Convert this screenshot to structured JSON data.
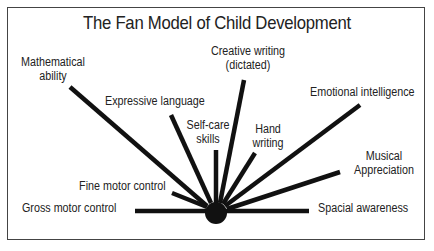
{
  "title": "The Fan Model of Child Development",
  "colors": {
    "line": "#111111",
    "text": "#222222",
    "border": "#444444",
    "background": "#ffffff"
  },
  "hub": {
    "cx": 216,
    "cy": 213,
    "r": 11
  },
  "spokes": [
    {
      "id": "mathematical-ability",
      "label": "Mathematical\nability",
      "line": [
        70,
        87,
        207,
        206
      ]
    },
    {
      "id": "expressive-language",
      "label": "Expressive language",
      "line": [
        171,
        115,
        211,
        203
      ]
    },
    {
      "id": "self-care-skills",
      "label": "Self-care\nskills",
      "line": [
        216,
        150,
        216,
        200
      ]
    },
    {
      "id": "creative-writing",
      "label": "Creative writing\n(dictated)",
      "line": [
        244,
        80,
        221,
        201
      ]
    },
    {
      "id": "hand-writing",
      "label": "Hand\nwriting",
      "line": [
        255,
        153,
        224,
        203
      ]
    },
    {
      "id": "emotional-intelligence",
      "label": "Emotional intelligence",
      "line": [
        360,
        105,
        226,
        204
      ]
    },
    {
      "id": "musical-appreciation",
      "label": "Musical\nAppreciation",
      "line": [
        340,
        172,
        228,
        208
      ]
    },
    {
      "id": "spacial-awareness",
      "label": "Spacial awareness",
      "line": [
        309,
        211,
        230,
        211
      ]
    },
    {
      "id": "gross-motor-control",
      "label": "Gross motor control",
      "line": [
        135,
        211,
        203,
        211
      ]
    },
    {
      "id": "fine-motor-control",
      "label": "Fine motor control",
      "line": [
        172,
        193,
        205,
        207
      ]
    }
  ],
  "labels": {
    "mathematical_line1": "Mathematical",
    "mathematical_line2": "ability",
    "expressive_language": "Expressive language",
    "self_care_line1": "Self-care",
    "self_care_line2": "skills",
    "creative_writing_line1": "Creative writing",
    "creative_writing_line2": "(dictated)",
    "hand_writing_line1": "Hand",
    "hand_writing_line2": "writing",
    "emotional_intelligence": "Emotional intelligence",
    "musical_line1": "Musical",
    "musical_line2": "Appreciation",
    "spacial_awareness": "Spacial awareness",
    "gross_motor_control": "Gross motor control",
    "fine_motor_control": "Fine motor control"
  }
}
